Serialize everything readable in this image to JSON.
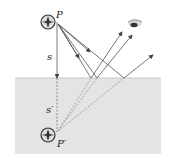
{
  "diagram": {
    "labels": {
      "object": "P",
      "image": "P′",
      "object_distance": "s",
      "image_distance": "s′"
    },
    "colors": {
      "mirror_fill": "#e4e4e4",
      "ray": "#555555",
      "ray_virtual": "#888888"
    },
    "elements": [
      "object-point-P",
      "image-point-P-prime",
      "mirror-surface",
      "eye",
      "incident-rays",
      "reflected-rays",
      "virtual-rays"
    ]
  }
}
